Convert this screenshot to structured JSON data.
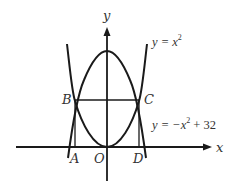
{
  "diagram": {
    "axes": {
      "x_label": "x",
      "y_label": "y",
      "origin_label": "O"
    },
    "curves": [
      {
        "name": "upward-parabola",
        "equation_lhs": "y = x",
        "exponent": "2",
        "equation_rhs": ""
      },
      {
        "name": "downward-parabola",
        "equation_lhs": "y = −x",
        "exponent": "2",
        "equation_rhs": " + 32"
      }
    ],
    "points": {
      "A": "A",
      "B": "B",
      "C": "C",
      "D": "D"
    },
    "colors": {
      "stroke": "#1a1a1a",
      "text": "#333333",
      "background": "#ffffff"
    }
  }
}
